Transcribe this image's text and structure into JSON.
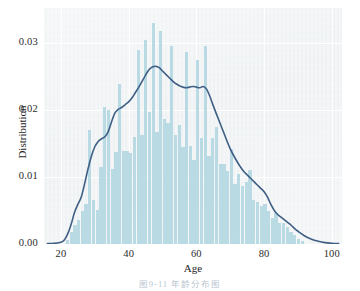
{
  "figure": {
    "caption": "图9-11  年龄分布图",
    "background": "#ffffff"
  },
  "colors": {
    "bar": "#b4d8e2",
    "kde_line": "#3f5f85",
    "axes_background": "#eceff1",
    "gridline": "#ffffff",
    "tick_text": "#2b2b2b"
  },
  "chart_data": {
    "type": "bar",
    "title": "",
    "subtitle": "",
    "xlabel": "Age",
    "ylabel": "Distribution",
    "xlim": [
      15,
      103
    ],
    "ylim": [
      0.0,
      0.0352
    ],
    "grid": true,
    "legend": null,
    "xticks": [
      "20",
      "40",
      "60",
      "80",
      "100"
    ],
    "xtick_values": [
      20,
      40,
      60,
      80,
      100
    ],
    "yticks": [
      "0.00",
      "0.01",
      "0.02",
      "0.03"
    ],
    "ytick_values": [
      0.0,
      0.01,
      0.02,
      0.03
    ],
    "bin_width": 1.1,
    "categories": [
      22,
      23.1,
      24.2,
      25.3,
      26.4,
      27.5,
      28.6,
      29.7,
      30.8,
      31.9,
      33.0,
      34.1,
      35.2,
      36.3,
      37.4,
      38.5,
      39.6,
      40.7,
      41.8,
      42.9,
      44.0,
      45.1,
      46.2,
      47.3,
      48.4,
      49.5,
      50.6,
      51.7,
      52.8,
      53.9,
      55.0,
      56.1,
      57.2,
      58.3,
      59.4,
      60.5,
      61.6,
      62.7,
      63.8,
      64.9,
      66.0,
      67.1,
      68.2,
      69.3,
      70.4,
      71.5,
      72.6,
      73.7,
      74.8,
      75.9,
      77.0,
      78.1,
      79.2,
      80.3,
      81.4,
      82.5,
      83.6,
      84.7,
      85.8,
      86.9,
      88.0,
      89.1,
      90.2,
      91.3
    ],
    "values": [
      0.0006,
      0.0018,
      0.0028,
      0.0036,
      0.0049,
      0.006,
      0.017,
      0.0065,
      0.005,
      0.0115,
      0.0205,
      0.02,
      0.0112,
      0.0137,
      0.0239,
      0.0139,
      0.0139,
      0.0136,
      0.016,
      0.029,
      0.0163,
      0.0305,
      0.0197,
      0.033,
      0.0167,
      0.0318,
      0.0187,
      0.018,
      0.0296,
      0.0162,
      0.0177,
      0.0145,
      0.0287,
      0.0146,
      0.0126,
      0.0275,
      0.0158,
      0.0296,
      0.0132,
      0.0158,
      0.0175,
      0.012,
      0.012,
      0.0109,
      0.0142,
      0.0089,
      0.0104,
      0.0086,
      0.0092,
      0.0111,
      0.0066,
      0.0063,
      0.0057,
      0.006,
      0.0049,
      0.0039,
      0.0046,
      0.0032,
      0.0031,
      0.0026,
      0.0018,
      0.0014,
      0.0008,
      0.0004
    ],
    "kde": {
      "name": "Distribution (KDE)",
      "color": "#3f5f85",
      "line_width": 1.6,
      "x": [
        16,
        18,
        20,
        21,
        22,
        23,
        24,
        25,
        26,
        27,
        28,
        29,
        30,
        31,
        32,
        33,
        34,
        35,
        36,
        37,
        38,
        39,
        40,
        41,
        42,
        43,
        44,
        45,
        46,
        47,
        48,
        49,
        50,
        51,
        52,
        53,
        54,
        55,
        56,
        57,
        58,
        59,
        60,
        61,
        62,
        63,
        64,
        65,
        66,
        67,
        68,
        69,
        70,
        71,
        72,
        73,
        74,
        75,
        76,
        77,
        78,
        79,
        80,
        81,
        82,
        83,
        84,
        85,
        86,
        87,
        88,
        89,
        90,
        92,
        94,
        96,
        98,
        100,
        102
      ],
      "y": [
        5e-05,
        0.0001,
        0.00025,
        0.0006,
        0.0015,
        0.0029,
        0.0047,
        0.0059,
        0.007,
        0.009,
        0.0112,
        0.0131,
        0.0145,
        0.0153,
        0.0157,
        0.016,
        0.0168,
        0.0183,
        0.0196,
        0.0201,
        0.0204,
        0.0208,
        0.0212,
        0.0218,
        0.0226,
        0.0234,
        0.0243,
        0.0252,
        0.026,
        0.0264,
        0.0265,
        0.0263,
        0.0258,
        0.0253,
        0.0248,
        0.0243,
        0.0239,
        0.0236,
        0.0234,
        0.0233,
        0.0234,
        0.0235,
        0.0234,
        0.0233,
        0.0235,
        0.0231,
        0.022,
        0.0206,
        0.0193,
        0.018,
        0.0167,
        0.0154,
        0.0142,
        0.0132,
        0.0123,
        0.0115,
        0.0108,
        0.0103,
        0.0098,
        0.0093,
        0.0088,
        0.0083,
        0.0078,
        0.007,
        0.0059,
        0.005,
        0.0044,
        0.004,
        0.0036,
        0.0032,
        0.0028,
        0.0023,
        0.0019,
        0.0012,
        0.0007,
        0.0004,
        0.0002,
        0.0001,
        5e-05
      ]
    }
  }
}
